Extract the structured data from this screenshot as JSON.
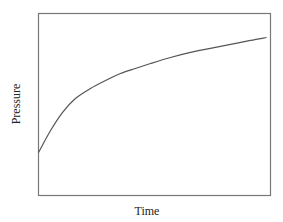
{
  "chart_data": {
    "type": "line",
    "title": "",
    "xlabel": "Time",
    "ylabel": "Pressure",
    "xlim": [
      0,
      100
    ],
    "ylim": [
      0,
      100
    ],
    "grid": false,
    "legend": null,
    "ticks": false,
    "series": [
      {
        "name": "Pressure",
        "color": "#555555",
        "x": [
          0,
          5.2,
          10.3,
          15.9,
          22.4,
          28.9,
          35.3,
          41.8,
          48.3,
          56.9,
          65.5,
          74.1,
          82.8,
          91.4,
          98.3
        ],
        "y": [
          23.6,
          35.7,
          45.6,
          53.3,
          58.8,
          63.2,
          67.0,
          69.8,
          72.5,
          75.8,
          78.6,
          80.8,
          83.0,
          85.2,
          86.8
        ]
      }
    ]
  },
  "colors": {
    "frame": "#777777",
    "line": "#555555",
    "text": "#222222"
  }
}
